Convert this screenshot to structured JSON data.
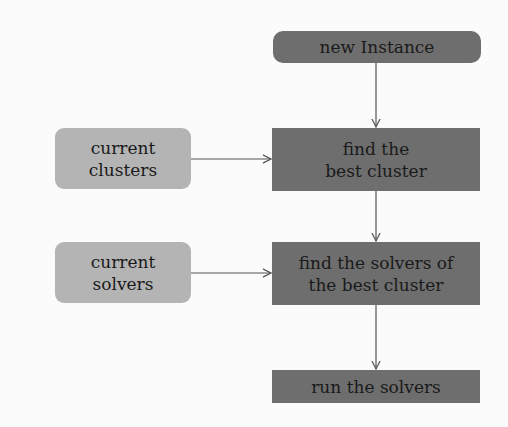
{
  "diagram": {
    "type": "flowchart",
    "nodes": [
      {
        "id": "new_instance",
        "label": "new Instance",
        "lines": [
          "new Instance"
        ],
        "style": "dark-rounded"
      },
      {
        "id": "find_best_cluster",
        "label": "find the best cluster",
        "lines": [
          "find the",
          "best cluster"
        ],
        "style": "dark"
      },
      {
        "id": "current_clusters",
        "label": "current clusters",
        "lines": [
          "current",
          "clusters"
        ],
        "style": "light-rounded"
      },
      {
        "id": "find_solvers",
        "label": "find the solvers of the best cluster",
        "lines": [
          "find the solvers of",
          "the best cluster"
        ],
        "style": "dark"
      },
      {
        "id": "current_solvers",
        "label": "current solvers",
        "lines": [
          "current",
          "solvers"
        ],
        "style": "light-rounded"
      },
      {
        "id": "run_solvers",
        "label": "run the solvers",
        "lines": [
          "run the solvers"
        ],
        "style": "dark"
      }
    ],
    "edges": [
      {
        "from": "new_instance",
        "to": "find_best_cluster"
      },
      {
        "from": "current_clusters",
        "to": "find_best_cluster"
      },
      {
        "from": "find_best_cluster",
        "to": "find_solvers"
      },
      {
        "from": "current_solvers",
        "to": "find_solvers"
      },
      {
        "from": "find_solvers",
        "to": "run_solvers"
      }
    ],
    "colors": {
      "dark_node": "#6e6e6e",
      "light_node": "#b4b4b4",
      "edge": "#555555",
      "background": "#fbfbfb"
    }
  }
}
